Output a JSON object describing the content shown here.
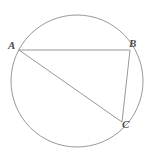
{
  "figure": {
    "background_color": "#ffffff",
    "stroke_color": "#8c8c8c",
    "label_color": "#4a4a4a",
    "stroke_width": 0.9,
    "width": 151,
    "height": 161
  },
  "circle": {
    "name": "circumscribed-circle",
    "cx": 77,
    "cy": 81,
    "r": 66
  },
  "points": [
    {
      "label": "A",
      "x": 19,
      "y": 50,
      "label_x": 8,
      "label_y": 40
    },
    {
      "label": "B",
      "x": 130,
      "y": 50,
      "label_x": 129,
      "label_y": 38
    },
    {
      "label": "C",
      "x": 122,
      "y": 122,
      "label_x": 122,
      "label_y": 119
    }
  ],
  "chords": [
    {
      "name": "chord-AB",
      "from": "A",
      "to": "B",
      "x1": 19,
      "y1": 50,
      "x2": 130,
      "y2": 50
    },
    {
      "name": "chord-AC",
      "from": "A",
      "to": "C",
      "x1": 19,
      "y1": 50,
      "x2": 122,
      "y2": 122
    },
    {
      "name": "chord-BC",
      "from": "B",
      "to": "C",
      "x1": 130,
      "y1": 50,
      "x2": 122,
      "y2": 122
    }
  ]
}
